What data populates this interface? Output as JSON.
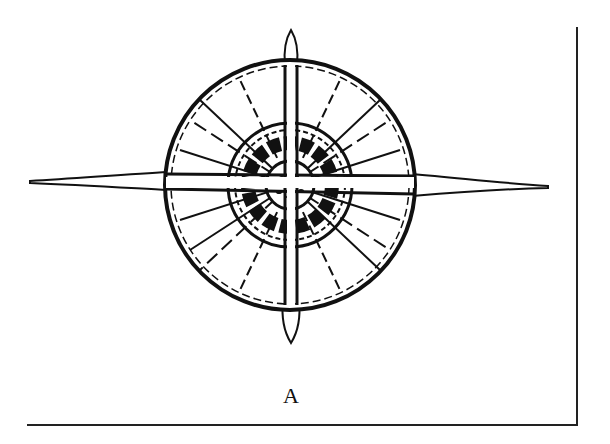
{
  "figure": {
    "label": "A",
    "stroke_color": "#111111",
    "background": "#ffffff"
  }
}
